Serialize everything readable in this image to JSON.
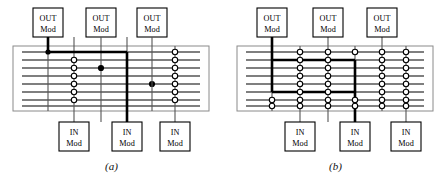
{
  "figure": {
    "panels": [
      {
        "id": "a",
        "caption": "(a)",
        "out_modules": [
          {
            "label_line1": "OUT",
            "label_line2": "Mod",
            "column": 1
          },
          {
            "label_line1": "OUT",
            "label_line2": "Mod",
            "column": 2
          },
          {
            "label_line1": "OUT",
            "label_line2": "Mod",
            "column": 4
          }
        ],
        "in_modules": [
          {
            "label_line1": "IN",
            "label_line2": "Mod",
            "column": 2
          },
          {
            "label_line1": "IN",
            "label_line2": "Mod",
            "column": 3
          },
          {
            "label_line1": "IN",
            "label_line2": "Mod",
            "column": 5
          }
        ],
        "grid": {
          "rows": 8,
          "columns": 5
        },
        "open_crosspoint_columns": [
          2,
          5
        ],
        "closed_crosspoints": [
          {
            "column": 3,
            "row": 2
          },
          {
            "column": 4,
            "row": 4
          }
        ],
        "active_path": {
          "enters_column": 1,
          "travels_row": 1,
          "exits_column": 3
        }
      },
      {
        "id": "b",
        "caption": "(b)",
        "out_modules": [
          {
            "label_line1": "OUT",
            "label_line2": "Mod",
            "column": 1
          },
          {
            "label_line1": "OUT",
            "label_line2": "Mod",
            "column": 2
          },
          {
            "label_line1": "OUT",
            "label_line2": "Mod",
            "column": 3
          }
        ],
        "in_modules": [
          {
            "label_line1": "IN",
            "label_line2": "Mod",
            "column": 2
          },
          {
            "label_line1": "IN",
            "label_line2": "Mod",
            "column": 3
          },
          {
            "label_line1": "IN",
            "label_line2": "Mod",
            "column": 5
          }
        ],
        "grid": {
          "rows": 8,
          "columns": 6
        },
        "open_crosspoint_columns": [
          2,
          3,
          4,
          5,
          6
        ],
        "closed_crosspoints": [],
        "active_path": {
          "enters_column": 1,
          "travels_rows": [
            2,
            6
          ],
          "exits_column": 4
        }
      }
    ],
    "colors": {
      "line": "#555555",
      "bold_line": "#000000",
      "box_border": "#000000",
      "frame": "#888888",
      "background": "#ffffff",
      "crosspoint_open_fill": "#ffffff",
      "crosspoint_closed_fill": "#000000"
    }
  }
}
